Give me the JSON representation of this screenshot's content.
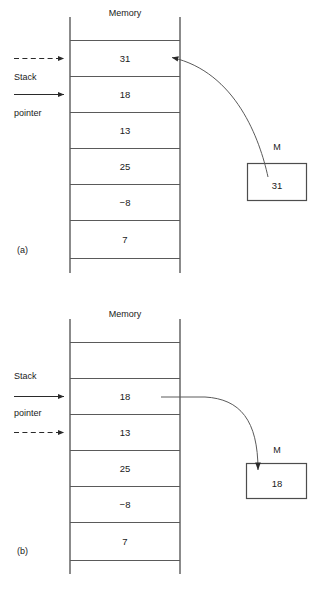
{
  "figure": {
    "line_color": "#4d4d4d",
    "text_color": "#1a1a1a",
    "background": "#ffffff"
  },
  "panels": [
    {
      "id": "a",
      "label": "(a)",
      "column_title": "Memory",
      "cells": [
        "31",
        "18",
        "13",
        "25",
        "−8",
        "7"
      ],
      "pointers": [
        {
          "style": "dashed",
          "target_row": 0,
          "name": "stack-pointer-dashed"
        },
        {
          "style": "solid",
          "target_row": 1,
          "name": "stack-pointer-solid"
        }
      ],
      "side_label_top": "Stack",
      "side_label_bottom": "pointer",
      "register": {
        "label": "M",
        "value": "31"
      },
      "arrow_direction": "register-to-memory",
      "arrow_target_row": 0
    },
    {
      "id": "b",
      "label": "(b)",
      "column_title": "Memory",
      "cells": [
        "",
        "18",
        "13",
        "25",
        "−8",
        "7"
      ],
      "pointers": [
        {
          "style": "solid",
          "target_row": 1,
          "name": "stack-pointer-solid"
        },
        {
          "style": "dashed",
          "target_row": 2,
          "name": "stack-pointer-dashed"
        }
      ],
      "side_label_top": "Stack",
      "side_label_bottom": "pointer",
      "register": {
        "label": "M",
        "value": "18"
      },
      "arrow_direction": "memory-to-register",
      "arrow_source_row": 1
    }
  ]
}
